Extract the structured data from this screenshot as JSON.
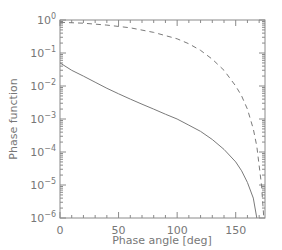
{
  "chart_data": {
    "type": "line",
    "title": "",
    "xlabel": "Phase angle [deg]",
    "ylabel": "Phase function",
    "xlim": [
      0,
      175
    ],
    "ylim": [
      1e-06,
      1
    ],
    "yscale": "log",
    "xticks": [
      0,
      50,
      100,
      150
    ],
    "xtick_labels": [
      "0",
      "50",
      "100",
      "150"
    ],
    "yticks": [
      1,
      0.1,
      0.01,
      0.001,
      0.0001,
      1e-05,
      1e-06
    ],
    "ytick_labels": [
      {
        "base": "10",
        "exp": "0"
      },
      {
        "base": "10",
        "exp": "−1"
      },
      {
        "base": "10",
        "exp": "−2"
      },
      {
        "base": "10",
        "exp": "−3"
      },
      {
        "base": "10",
        "exp": "−4"
      },
      {
        "base": "10",
        "exp": "−5"
      },
      {
        "base": "10",
        "exp": "−6"
      }
    ],
    "grid": false,
    "legend": null,
    "series": [
      {
        "name": "solid",
        "style": "solid",
        "x": [
          0,
          10,
          20,
          30,
          40,
          50,
          60,
          70,
          80,
          90,
          100,
          110,
          120,
          130,
          140,
          150,
          155,
          160,
          165,
          168
        ],
        "y": [
          0.05,
          0.03,
          0.02,
          0.013,
          0.0085,
          0.0058,
          0.004,
          0.0028,
          0.002,
          0.0014,
          0.001,
          0.00065,
          0.00042,
          0.00024,
          0.00012,
          5e-05,
          2.7e-05,
          1.2e-05,
          4e-06,
          1e-06
        ]
      },
      {
        "name": "dashed",
        "style": "dashed",
        "x": [
          0,
          20,
          40,
          60,
          80,
          100,
          110,
          120,
          130,
          140,
          150,
          155,
          160,
          165,
          168,
          170,
          172,
          174
        ],
        "y": [
          0.85,
          0.8,
          0.7,
          0.58,
          0.42,
          0.27,
          0.19,
          0.12,
          0.065,
          0.03,
          0.01,
          0.005,
          0.002,
          0.0005,
          0.00015,
          4e-05,
          1e-05,
          1e-06
        ]
      }
    ]
  }
}
